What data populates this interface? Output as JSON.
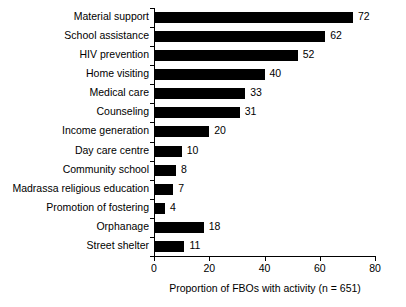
{
  "chart_data": {
    "type": "bar",
    "orientation": "horizontal",
    "title": "",
    "xlabel": "Proportion of FBOs with activity (n = 651)",
    "ylabel": "",
    "xlim": [
      0,
      80
    ],
    "xticks": [
      0,
      20,
      40,
      60,
      80
    ],
    "grid": false,
    "legend": null,
    "bar_color": "#000000",
    "categories": [
      "Material support",
      "School assistance",
      "HIV prevention",
      "Home visiting",
      "Medical care",
      "Counseling",
      "Income generation",
      "Day care centre",
      "Community school",
      "Madrassa religious education",
      "Promotion of fostering",
      "Orphanage",
      "Street shelter"
    ],
    "values": [
      72,
      62,
      52,
      40,
      33,
      31,
      20,
      10,
      8,
      7,
      4,
      18,
      11
    ],
    "data_labels": [
      "72",
      "62",
      "52",
      "40",
      "33",
      "31",
      "20",
      "10",
      "8",
      "7",
      "4",
      "18",
      "11"
    ],
    "xtick_labels": [
      "0",
      "20",
      "40",
      "60",
      "80"
    ]
  }
}
